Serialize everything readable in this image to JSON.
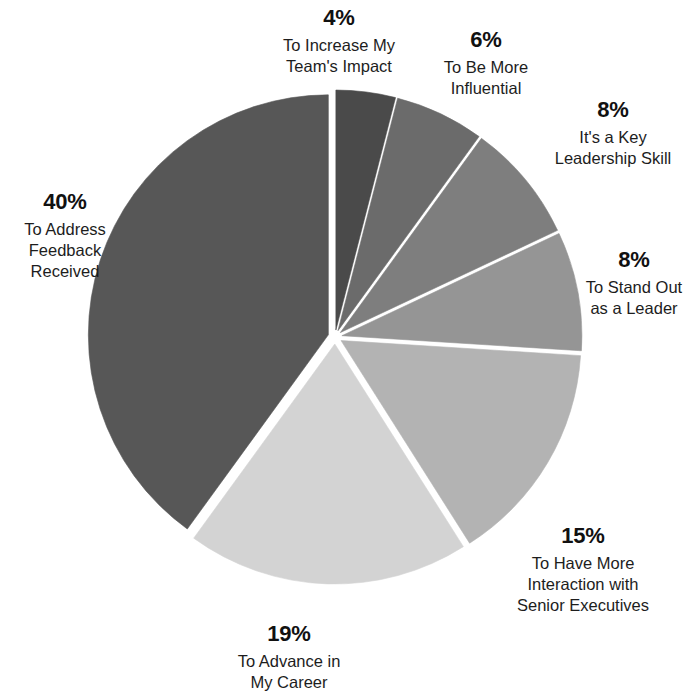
{
  "chart_data": {
    "type": "pie",
    "title": "",
    "subtitle": "",
    "xlabel": "",
    "ylabel": "",
    "legend_position": "none",
    "grid": false,
    "units": "percent",
    "total": 100,
    "categories": [
      "To Increase My Team's Impact",
      "To Be More Influential",
      "It's a Key Leadership Skill",
      "To Stand Out as a Leader",
      "To Have More Interaction with Senior Executives",
      "To Advance in My Career",
      "To Address Feedback Received"
    ],
    "values": [
      4,
      6,
      8,
      8,
      15,
      19,
      40
    ],
    "value_labels": [
      "4%",
      "6%",
      "8%",
      "8%",
      "15%",
      "19%",
      "40%"
    ],
    "colors": [
      "#4a4a4a",
      "#6b6b6b",
      "#7e7e7e",
      "#959595",
      "#b3b3b3",
      "#d3d3d3",
      "#575757"
    ],
    "slices": [
      {
        "id": "increase-team-impact",
        "percent": 4,
        "percent_label": "4%",
        "label": "To Increase My\nTeam's Impact",
        "label_flat": "To Increase My Team's Impact",
        "color": "#4a4a4a",
        "start_angle": 0,
        "end_angle": 14.4
      },
      {
        "id": "be-more-influential",
        "percent": 6,
        "percent_label": "6%",
        "label": "To Be More\nInfluential",
        "label_flat": "To Be More Influential",
        "color": "#6b6b6b",
        "start_angle": 14.4,
        "end_angle": 36.0
      },
      {
        "id": "key-leadership-skill",
        "percent": 8,
        "percent_label": "8%",
        "label": "It's a Key\nLeadership Skill",
        "label_flat": "It's a Key Leadership Skill",
        "color": "#7e7e7e",
        "start_angle": 36.0,
        "end_angle": 64.8
      },
      {
        "id": "stand-out-as-leader",
        "percent": 8,
        "percent_label": "8%",
        "label": "To Stand Out\nas a Leader",
        "label_flat": "To Stand Out as a Leader",
        "color": "#959595",
        "start_angle": 64.8,
        "end_angle": 93.6
      },
      {
        "id": "interaction-senior-executives",
        "percent": 15,
        "percent_label": "15%",
        "label": "To Have More\nInteraction with\nSenior Executives",
        "label_flat": "To Have More Interaction with Senior Executives",
        "color": "#b3b3b3",
        "start_angle": 93.6,
        "end_angle": 147.6
      },
      {
        "id": "advance-in-my-career",
        "percent": 19,
        "percent_label": "19%",
        "label": "To Advance in\nMy Career",
        "label_flat": "To Advance in My Career",
        "color": "#d3d3d3",
        "start_angle": 147.6,
        "end_angle": 216.0
      },
      {
        "id": "address-feedback-received",
        "percent": 40,
        "percent_label": "40%",
        "label": "To Address\nFeedback\nReceived",
        "label_flat": "To Address Feedback Received",
        "color": "#575757",
        "start_angle": 216.0,
        "end_angle": 360.0
      }
    ]
  },
  "geometry": {
    "center_x": 335,
    "center_y": 337,
    "radius": 240,
    "explode": 7
  }
}
